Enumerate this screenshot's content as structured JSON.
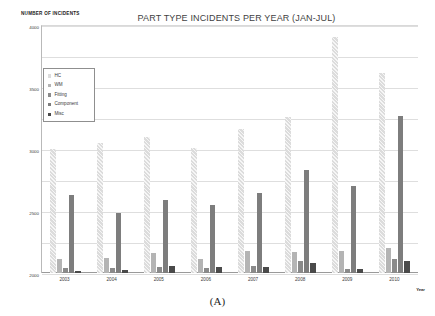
{
  "chart_data": {
    "type": "bar",
    "title": "PART TYPE INCIDENTS PER YEAR (JAN-JUL)",
    "ylabel": "NUMBER OF INCIDENTS",
    "xlabel": "Year",
    "categories": [
      "2003",
      "2004",
      "2005",
      "2006",
      "2007",
      "2008",
      "2009",
      "2010"
    ],
    "series": [
      {
        "name": "HC",
        "color": "#dcdcdc",
        "values": [
          2000,
          2090,
          2195,
          2010,
          2330,
          2520,
          3800,
          3230
        ]
      },
      {
        "name": "WM",
        "color": "#b4b4b4",
        "values": [
          225,
          240,
          315,
          220,
          360,
          345,
          355,
          410
        ]
      },
      {
        "name": "Fitting",
        "color": "#8a8a8a",
        "values": [
          75,
          80,
          95,
          85,
          115,
          190,
          70,
          230
        ]
      },
      {
        "name": "Component",
        "color": "#7d7d7d",
        "values": [
          1265,
          975,
          1170,
          1105,
          1285,
          1660,
          1405,
          2535
        ]
      },
      {
        "name": "Misc",
        "color": "#4a4a4a",
        "values": [
          35,
          55,
          115,
          105,
          105,
          155,
          60,
          190
        ]
      }
    ],
    "ylim": [
      0,
      4000
    ],
    "yticks": [
      0,
      500,
      1000,
      1500,
      2000,
      2500,
      3000,
      3500,
      4000
    ],
    "grid": true,
    "legend_position": "inside-top-left"
  },
  "caption": "(A)"
}
